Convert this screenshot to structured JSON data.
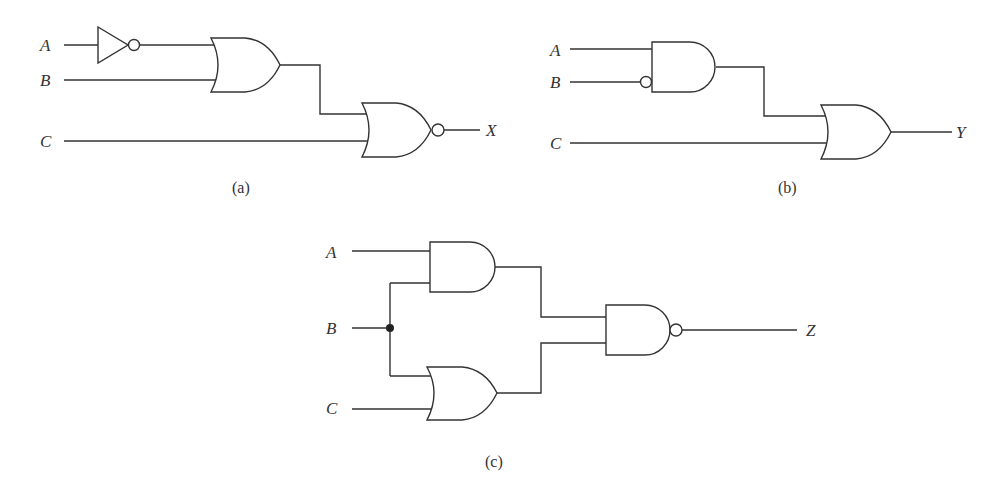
{
  "diagram": {
    "type": "logic-circuits",
    "panels": [
      {
        "id": "a",
        "caption": "(a)",
        "inputs": [
          "A",
          "B",
          "C"
        ],
        "output": "X",
        "gates": [
          {
            "name": "not-gate",
            "type": "NOT",
            "inputs": [
              "A"
            ]
          },
          {
            "name": "or-gate",
            "type": "OR",
            "inputs": [
              "NOT A",
              "B"
            ]
          },
          {
            "name": "nor-gate",
            "type": "NOR",
            "inputs": [
              "OR output",
              "C"
            ],
            "output": "X"
          }
        ]
      },
      {
        "id": "b",
        "caption": "(b)",
        "inputs": [
          "A",
          "B",
          "C"
        ],
        "output": "Y",
        "gates": [
          {
            "name": "and-gate",
            "type": "AND",
            "inputs": [
              "A",
              "NOT B (inverted input bubble)"
            ]
          },
          {
            "name": "or-gate",
            "type": "OR",
            "inputs": [
              "AND output",
              "C"
            ],
            "output": "Y"
          }
        ]
      },
      {
        "id": "c",
        "caption": "(c)",
        "inputs": [
          "A",
          "B",
          "C"
        ],
        "output": "Z",
        "gates": [
          {
            "name": "and-gate",
            "type": "AND",
            "inputs": [
              "A",
              "B"
            ]
          },
          {
            "name": "or-gate",
            "type": "OR",
            "inputs": [
              "B",
              "C"
            ]
          },
          {
            "name": "nand-gate",
            "type": "NAND",
            "inputs": [
              "AND output",
              "OR output"
            ],
            "output": "Z"
          }
        ],
        "junctions": [
          "B splits to AND and OR"
        ]
      }
    ]
  },
  "labels": {
    "a": {
      "A": "A",
      "B": "B",
      "C": "C",
      "X": "X",
      "caption": "(a)"
    },
    "b": {
      "A": "A",
      "B": "B",
      "C": "C",
      "Y": "Y",
      "caption": "(b)"
    },
    "c": {
      "A": "A",
      "B": "B",
      "C": "C",
      "Z": "Z",
      "caption": "(c)"
    }
  },
  "colors": {
    "line": "#333333",
    "background": "#ffffff"
  }
}
